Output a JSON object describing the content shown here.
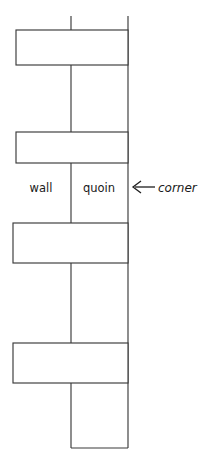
{
  "diagram": {
    "type": "architectural-masonry-diagram",
    "canvas": {
      "width": 203,
      "height": 456,
      "background": "#ffffff"
    },
    "stroke_color": "#3a3a3a",
    "text_color": "#1a1a1a",
    "labels": [
      {
        "id": "wall",
        "text": "wall",
        "x": 27,
        "y": 192,
        "italic": false
      },
      {
        "id": "quoin",
        "text": "quoin",
        "x": 77,
        "y": 192,
        "italic": false
      },
      {
        "id": "corner",
        "text": "corner",
        "x": 158,
        "y": 192,
        "italic": true
      }
    ],
    "arrow": {
      "id": "corner-arrow",
      "direction": "left",
      "tail_x": 155,
      "head_x": 133,
      "y": 187
    },
    "stones": [
      {
        "id": "stone-1",
        "x": 16,
        "y": 30,
        "width": 112,
        "height": 35
      },
      {
        "id": "stone-2",
        "x": 16,
        "y": 132,
        "width": 112,
        "height": 31
      },
      {
        "id": "stone-3",
        "x": 13,
        "y": 223,
        "width": 115,
        "height": 40
      },
      {
        "id": "stone-4",
        "x": 13,
        "y": 343,
        "width": 115,
        "height": 40
      }
    ],
    "guides": [
      {
        "id": "inner-vertical",
        "x1": 71,
        "y1": 16,
        "x2": 71,
        "y2": 448
      },
      {
        "id": "outer-vertical",
        "x1": 128,
        "y1": 16,
        "x2": 128,
        "y2": 448
      },
      {
        "id": "bottom-horizontal",
        "x1": 71,
        "y1": 448,
        "x2": 128,
        "y2": 448
      }
    ]
  }
}
